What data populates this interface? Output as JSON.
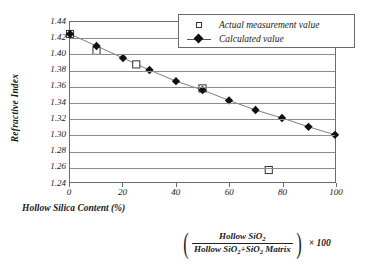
{
  "chart_data": {
    "type": "scatter",
    "title": "",
    "xlabel": "Hollow Silica Content (%)",
    "ylabel": "Refractive Index",
    "xlim": [
      0,
      100
    ],
    "ylim": [
      1.24,
      1.44
    ],
    "xticks": [
      "0",
      "20",
      "40",
      "60",
      "80",
      "100"
    ],
    "xtick_values": [
      0,
      20,
      40,
      60,
      80,
      100
    ],
    "yticks": [
      "1.44",
      "1.42",
      "1.40",
      "1.38",
      "1.36",
      "1.34",
      "1.32",
      "1.30",
      "1.28",
      "1.26",
      "1.24"
    ],
    "ytick_values": [
      1.44,
      1.42,
      1.4,
      1.38,
      1.36,
      1.34,
      1.32,
      1.3,
      1.28,
      1.26,
      1.24
    ],
    "grid": "horizontal",
    "legend_position": "top-right",
    "series": [
      {
        "name": "Actual measurement value",
        "marker": "open-square",
        "line": "none",
        "x": [
          0,
          10,
          25,
          50,
          75
        ],
        "y": [
          1.425,
          1.404,
          1.387,
          1.357,
          1.255
        ]
      },
      {
        "name": "Calculated value",
        "marker": "filled-diamond",
        "line": "solid",
        "x": [
          0,
          10,
          20,
          30,
          40,
          50,
          60,
          70,
          80,
          90,
          100
        ],
        "y": [
          1.425,
          1.41,
          1.395,
          1.38,
          1.366,
          1.355,
          1.342,
          1.33,
          1.32,
          1.309,
          1.299
        ]
      }
    ]
  },
  "legend": {
    "items": [
      {
        "label": "Actual measurement value",
        "marker": "open-square"
      },
      {
        "label": "Calculated value",
        "marker": "filled-diamond-line"
      }
    ]
  },
  "formula": {
    "open_paren": "(",
    "close_paren": ")",
    "numerator": "Hollow SiO",
    "numerator_sub": "2",
    "denominator_a": "Hollow SiO",
    "denominator_a_sub": "2",
    "denominator_b": "+SiO",
    "denominator_b_sub": "2",
    "denominator_c": " Matrix",
    "multiplier": "× 100"
  },
  "colors": {
    "axis": "#6b6b6b",
    "grid": "#8c8c8c",
    "line": "#6e6e6e",
    "marker_fill": "#111111",
    "marker_open": "#ffffff",
    "marker_edge": "#303030",
    "background": "#ffffff"
  }
}
